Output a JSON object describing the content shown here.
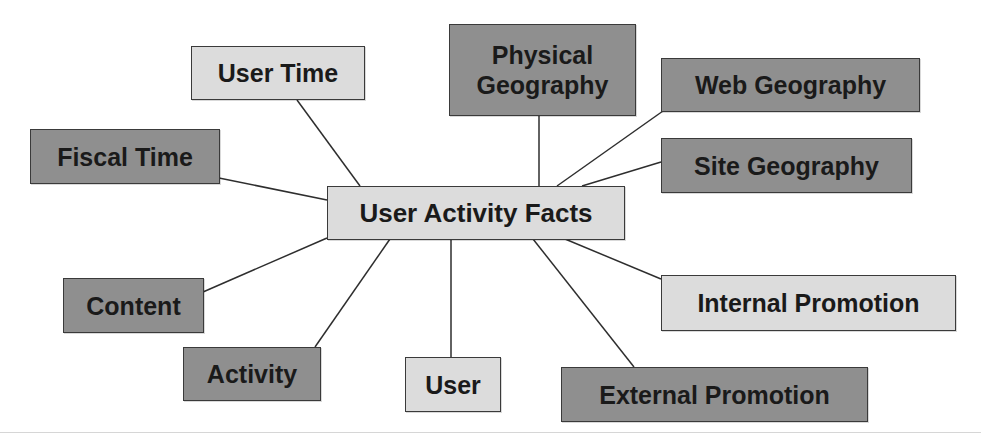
{
  "diagram": {
    "center": {
      "id": "user-activity-facts",
      "label": "User Activity Facts",
      "shade": "light"
    },
    "dimensions": [
      {
        "id": "user-time",
        "label": "User Time",
        "shade": "light"
      },
      {
        "id": "fiscal-time",
        "label": "Fiscal Time",
        "shade": "dark"
      },
      {
        "id": "physical-geography",
        "label": "Physical\nGeography",
        "shade": "dark"
      },
      {
        "id": "web-geography",
        "label": "Web Geography",
        "shade": "dark"
      },
      {
        "id": "site-geography",
        "label": "Site Geography",
        "shade": "dark"
      },
      {
        "id": "content",
        "label": "Content",
        "shade": "dark"
      },
      {
        "id": "activity",
        "label": "Activity",
        "shade": "dark"
      },
      {
        "id": "user",
        "label": "User",
        "shade": "light"
      },
      {
        "id": "internal-promotion",
        "label": "Internal Promotion",
        "shade": "light"
      },
      {
        "id": "external-promotion",
        "label": "External Promotion",
        "shade": "dark"
      }
    ],
    "edges": [
      [
        "user-activity-facts",
        "user-time"
      ],
      [
        "user-activity-facts",
        "fiscal-time"
      ],
      [
        "user-activity-facts",
        "physical-geography"
      ],
      [
        "user-activity-facts",
        "web-geography"
      ],
      [
        "user-activity-facts",
        "site-geography"
      ],
      [
        "user-activity-facts",
        "content"
      ],
      [
        "user-activity-facts",
        "activity"
      ],
      [
        "user-activity-facts",
        "user"
      ],
      [
        "user-activity-facts",
        "internal-promotion"
      ],
      [
        "user-activity-facts",
        "external-promotion"
      ]
    ],
    "colors": {
      "dark_fill": "#8f8f8f",
      "light_fill": "#dcdcdc",
      "border": "#3a3a3a",
      "text": "#1a1a1a",
      "line": "#2e2e2e"
    }
  }
}
